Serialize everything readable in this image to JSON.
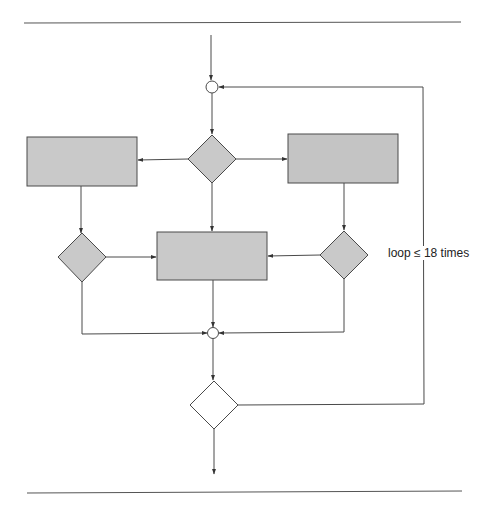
{
  "diagram": {
    "type": "flowchart",
    "colors": {
      "shape_fill": "#c9c9c9",
      "shape_stroke": "#4a4a4a",
      "empty_fill": "#ffffff",
      "line": "#4a4a4a",
      "rule": "#555555"
    },
    "nodes": [
      {
        "id": "merge-top",
        "shape": "circle",
        "label": ""
      },
      {
        "id": "decision-top",
        "shape": "diamond",
        "label": ""
      },
      {
        "id": "process-left",
        "shape": "rect",
        "label": ""
      },
      {
        "id": "process-right",
        "shape": "rect",
        "label": ""
      },
      {
        "id": "decision-left",
        "shape": "diamond",
        "label": ""
      },
      {
        "id": "decision-right",
        "shape": "diamond",
        "label": ""
      },
      {
        "id": "process-center",
        "shape": "rect",
        "label": ""
      },
      {
        "id": "merge-bottom",
        "shape": "circle",
        "label": ""
      },
      {
        "id": "decision-bottom",
        "shape": "diamond",
        "label": ""
      }
    ],
    "edges": [
      {
        "from": "entry",
        "to": "merge-top"
      },
      {
        "from": "merge-top",
        "to": "decision-top"
      },
      {
        "from": "decision-top",
        "to": "process-left"
      },
      {
        "from": "decision-top",
        "to": "process-right"
      },
      {
        "from": "decision-top",
        "to": "process-center"
      },
      {
        "from": "process-left",
        "to": "decision-left"
      },
      {
        "from": "process-right",
        "to": "decision-right"
      },
      {
        "from": "decision-left",
        "to": "process-center"
      },
      {
        "from": "decision-right",
        "to": "process-center"
      },
      {
        "from": "decision-left",
        "to": "merge-bottom"
      },
      {
        "from": "process-center",
        "to": "merge-bottom"
      },
      {
        "from": "decision-right",
        "to": "merge-bottom"
      },
      {
        "from": "merge-bottom",
        "to": "decision-bottom"
      },
      {
        "from": "decision-bottom",
        "to": "merge-top",
        "label": "loop ≤ 18 times"
      },
      {
        "from": "decision-bottom",
        "to": "exit"
      }
    ],
    "loop_label": "loop ≤ 18 times"
  }
}
